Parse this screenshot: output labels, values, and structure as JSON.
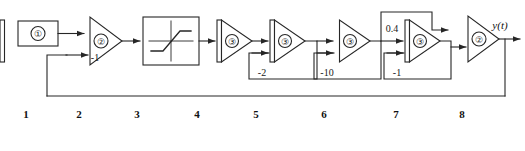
{
  "diagram": {
    "output_label": "y(t)",
    "stroke_color": "#262626",
    "background": "#ffffff",
    "blocks": [
      {
        "index": "1",
        "kind": "source-box",
        "symbol": "①",
        "caption": "1"
      },
      {
        "index": "2",
        "kind": "summer-triangle",
        "symbol": "②",
        "caption": "2",
        "gain_label": "-1"
      },
      {
        "index": "3",
        "kind": "saturation-block",
        "symbol": "",
        "caption": "3"
      },
      {
        "index": "4",
        "kind": "amplifier",
        "symbol": "③",
        "caption": "4"
      },
      {
        "index": "5",
        "kind": "amplifier",
        "symbol": "③",
        "caption": "5",
        "gain_label": "-2"
      },
      {
        "index": "6",
        "kind": "amplifier",
        "symbol": "③",
        "caption": "6",
        "gain_label": "-10"
      },
      {
        "index": "7",
        "kind": "amplifier",
        "symbol": "③",
        "caption": "7",
        "gain_label": "-1",
        "input_label": "0.4"
      },
      {
        "index": "8",
        "kind": "summer-triangle",
        "symbol": "②",
        "caption": "8"
      }
    ],
    "annotations": {
      "sum1_feedback_gain": "-1",
      "amp5_feedback_gain": "-2",
      "amp6_feedback_gain": "-10",
      "amp7_input_gain": "0.4",
      "amp7_feedback_gain": "-1"
    },
    "captions": [
      "1",
      "2",
      "3",
      "4",
      "5",
      "6",
      "7",
      "8"
    ]
  }
}
